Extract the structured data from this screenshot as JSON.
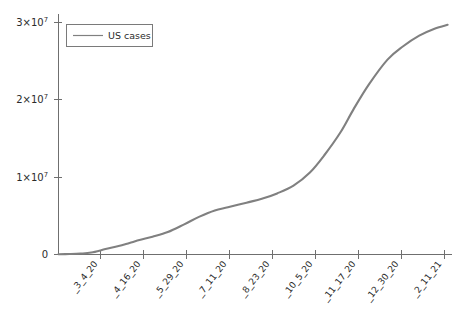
{
  "chart_data": {
    "type": "line",
    "title": "",
    "xlabel": "",
    "ylabel": "",
    "legend_position": "top-left",
    "grid": false,
    "xlim": [
      0,
      360
    ],
    "ylim": [
      0,
      31000000
    ],
    "y_ticks": [
      0,
      10000000,
      20000000,
      30000000
    ],
    "y_tick_labels": [
      "0",
      "1×10⁷",
      "2×10⁷",
      "3×10⁷"
    ],
    "x_tick_labels": [
      "_3_4_20",
      "_4_16_20",
      "_5_29_20",
      "_7_11_20",
      "_8_23_20",
      "_10_5_20",
      "_11_17_20",
      "_12_30_20",
      "_2_11_21"
    ],
    "x_tick_positions": [
      0,
      43,
      86,
      129,
      172,
      215,
      258,
      301,
      344
    ],
    "series": [
      {
        "name": "US cases",
        "color": "#808080",
        "x": [
          0,
          10,
          20,
          30,
          43,
          55,
          65,
          75,
          86,
          100,
          115,
          129,
          143,
          155,
          172,
          186,
          200,
          215,
          230,
          243,
          258,
          270,
          284,
          301,
          315,
          330,
          344,
          356
        ],
        "values": [
          30000,
          60000,
          120000,
          250000,
          700000,
          1100000,
          1500000,
          1900000,
          2300000,
          2900000,
          3900000,
          4900000,
          5700000,
          6100000,
          6700000,
          7200000,
          7900000,
          8900000,
          10600000,
          12800000,
          15800000,
          18800000,
          22000000,
          25200000,
          26900000,
          28300000,
          29200000,
          29700000
        ]
      }
    ],
    "legend_entries": [
      {
        "label": "US cases",
        "color": "#808080"
      }
    ],
    "axis_color": "#6f6f6f",
    "background": "#ffffff"
  },
  "figure": {
    "width": 470,
    "height": 318
  }
}
